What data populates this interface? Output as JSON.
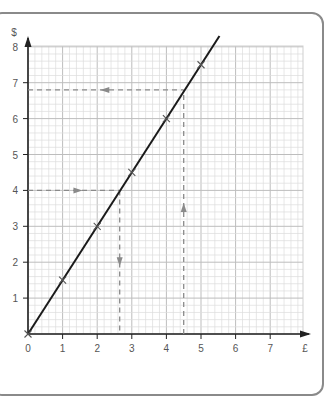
{
  "chart_data": {
    "type": "line",
    "title": "",
    "xlabel": "£",
    "ylabel": "$",
    "xlim": [
      0,
      8
    ],
    "ylim": [
      0,
      8
    ],
    "x_ticks": [
      "0",
      "1",
      "2",
      "3",
      "4",
      "5",
      "6",
      "7"
    ],
    "y_ticks": [
      "1",
      "2",
      "3",
      "4",
      "5",
      "6",
      "7",
      "8"
    ],
    "grid": true,
    "series": [
      {
        "name": "conversion line",
        "x": [
          0,
          1,
          2,
          3,
          4,
          5
        ],
        "y": [
          0,
          1.5,
          3,
          4.5,
          6,
          7.5
        ]
      }
    ],
    "markers": [
      {
        "x": 0,
        "y": 0
      },
      {
        "x": 1,
        "y": 1.5
      },
      {
        "x": 2,
        "y": 3
      },
      {
        "x": 3,
        "y": 4.5
      },
      {
        "x": 4,
        "y": 6
      },
      {
        "x": 5,
        "y": 7.5
      }
    ],
    "readings": [
      {
        "from_axis": "y",
        "value_in": 4,
        "value_out": 2.65,
        "description": "$4 -> about £2.65"
      },
      {
        "from_axis": "x",
        "value_in": 4.5,
        "value_out": 6.8,
        "description": "£4.50 -> about $6.80"
      }
    ]
  },
  "labels": {
    "x_axis_unit": "£",
    "y_axis_unit": "$",
    "origin": "0"
  }
}
